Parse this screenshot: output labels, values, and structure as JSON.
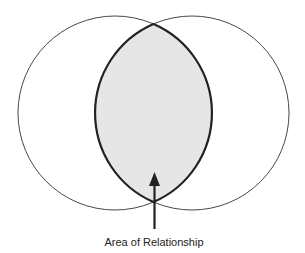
{
  "diagram": {
    "type": "venn",
    "circles": [
      {
        "name": "left-circle",
        "cx": 115,
        "cy": 113,
        "r": 97
      },
      {
        "name": "right-circle",
        "cx": 192,
        "cy": 113,
        "r": 97
      }
    ],
    "intersection": {
      "fill": "#e6e6e6",
      "stroke": "#222222"
    },
    "label": "Area of Relationship"
  }
}
